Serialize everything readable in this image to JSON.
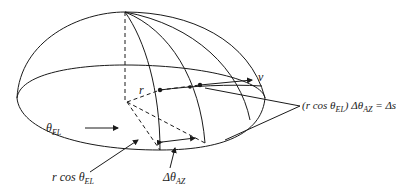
{
  "figure": {
    "type": "hemisphere-coordinate-diagram",
    "stroke_color": "#1a1a1a",
    "background": "#ffffff"
  },
  "labels": {
    "v": {
      "text": "v"
    },
    "r": {
      "text": "r"
    },
    "theta_el": {
      "symbol": "θ",
      "sub": "EL"
    },
    "r_cos": {
      "prefix": "r cos ",
      "symbol": "θ",
      "sub": "EL"
    },
    "delta_theta_az": {
      "symbol": "Δθ",
      "sub": "AZ"
    },
    "arc_eq": {
      "p1": "(r cos ",
      "symbol": "θ",
      "sub1": "EL",
      "p2": ") Δθ",
      "sub2": "AZ",
      "p3": " = Δs"
    }
  }
}
